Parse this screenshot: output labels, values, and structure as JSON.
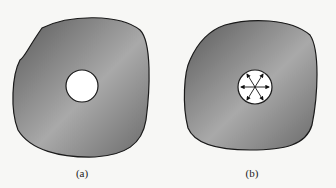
{
  "figure": {
    "panels": [
      {
        "label": "(a)",
        "description": "Plate with circular hole, unloaded"
      },
      {
        "label": "(b)",
        "description": "Plate with circular hole under internal pressure (radial arrows)"
      }
    ],
    "colors": {
      "plate_dark": "#5e5e5e",
      "plate_light": "#a8a8a8",
      "outline": "#1a1a1a",
      "hole": "#ffffff",
      "background": "#f7f7f5"
    }
  }
}
